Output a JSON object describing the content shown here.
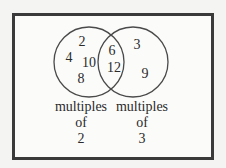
{
  "diagram": {
    "type": "venn",
    "sets": [
      {
        "name": "multiples of 2",
        "label_lines": [
          "multiples",
          "of",
          "2"
        ],
        "only_members": [
          "2",
          "4",
          "10",
          "8"
        ]
      },
      {
        "name": "multiples of 3",
        "label_lines": [
          "multiples",
          "of",
          "3"
        ],
        "only_members": [
          "3",
          "9"
        ]
      }
    ],
    "intersection": [
      "6",
      "12"
    ]
  }
}
